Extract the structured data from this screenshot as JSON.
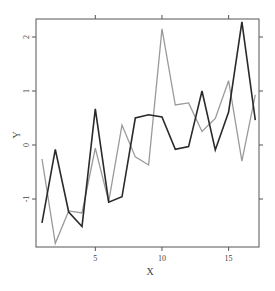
{
  "chart_data": {
    "type": "line",
    "title": "",
    "xlabel": "X",
    "ylabel": "Y",
    "x": [
      1,
      2,
      3,
      4,
      5,
      6,
      7,
      8,
      9,
      10,
      11,
      12,
      13,
      14,
      15,
      16,
      17
    ],
    "xlim": [
      0.5,
      17.3
    ],
    "ylim": [
      -2.05,
      2.4
    ],
    "x_ticks": [
      5,
      10,
      15
    ],
    "y_ticks": [
      -1,
      0,
      1,
      2
    ],
    "x_tick_labels": [
      "5",
      "10",
      "15"
    ],
    "y_tick_labels": [
      "-1",
      "0",
      "1",
      "2"
    ],
    "grid": false,
    "legend": null,
    "series": [
      {
        "name": "dark",
        "color": "#2a2a2a",
        "values": [
          -1.44,
          -0.08,
          -1.24,
          -1.51,
          0.67,
          -1.06,
          -0.96,
          0.5,
          0.56,
          0.52,
          -0.08,
          -0.03,
          1.0,
          -0.09,
          0.61,
          2.28,
          0.46
        ]
      },
      {
        "name": "light",
        "color": "#9a9a9a",
        "values": [
          -0.26,
          -1.82,
          -1.22,
          -1.26,
          -0.06,
          -1.05,
          0.37,
          -0.22,
          -0.37,
          2.15,
          0.74,
          0.78,
          0.25,
          0.49,
          1.19,
          -0.3,
          0.93
        ]
      }
    ]
  },
  "axes": {
    "x_title": "X",
    "y_title": "Y"
  }
}
